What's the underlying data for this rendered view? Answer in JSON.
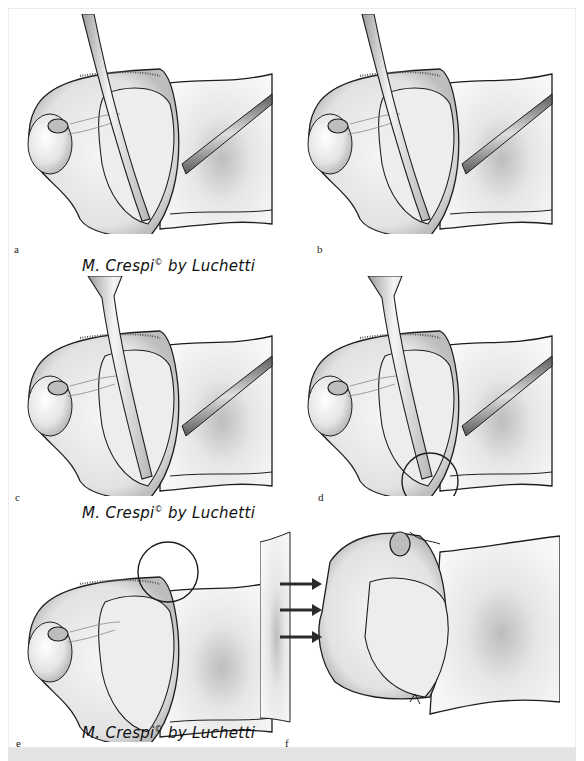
{
  "figure": {
    "panels": [
      {
        "id": "a",
        "label": "a",
        "variant": "probe-straight",
        "circle": null,
        "arrows": 0
      },
      {
        "id": "b",
        "label": "b",
        "variant": "probe-straight",
        "circle": null,
        "arrows": 0
      },
      {
        "id": "c",
        "label": "c",
        "variant": "probe-flared",
        "circle": null,
        "arrows": 0
      },
      {
        "id": "d",
        "label": "d",
        "variant": "probe-flared",
        "circle": "bottom",
        "arrows": 0
      },
      {
        "id": "e",
        "label": "e",
        "variant": "no-probe",
        "circle": "top",
        "arrows": 0
      },
      {
        "id": "f",
        "label": "f",
        "variant": "displaced",
        "circle": null,
        "arrows": 3
      }
    ],
    "signatures": [
      {
        "row": 1,
        "name": "M. Crespi",
        "mark": "©",
        "suffix": "by Luchetti"
      },
      {
        "row": 2,
        "name": "M. Crespi",
        "mark": "©",
        "suffix": "by Luchetti"
      },
      {
        "row": 3,
        "name": "M. Crespi",
        "mark": "©",
        "suffix": "by Luchetti"
      }
    ],
    "colors": {
      "ink": "#1e1e1e",
      "tissue_light": "#f2f2f2",
      "tissue_mid": "#cfcfcf",
      "tissue_dark": "#9a9a9a",
      "background": "#ffffff",
      "strip": "#e3e3e3"
    }
  }
}
